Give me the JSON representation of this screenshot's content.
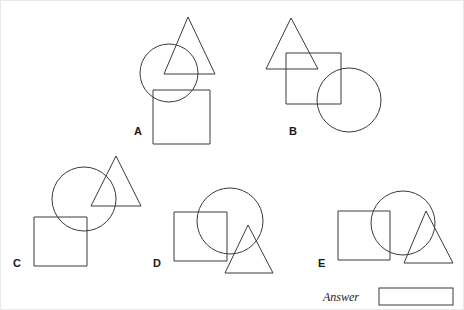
{
  "puzzle": {
    "type": "shape-overlap-multiple-choice",
    "background_color": "#ffffff",
    "stroke_color": "#3a3a3a",
    "options": [
      {
        "id": "A",
        "label": "A",
        "label_x": 133,
        "label_y": 134,
        "shapes": [
          {
            "kind": "triangle-icon",
            "points": "187,16 163,73 214,73"
          },
          {
            "kind": "circle-icon",
            "cx": 168,
            "cy": 72,
            "r": 29
          },
          {
            "kind": "square-icon",
            "x": 152,
            "y": 89,
            "w": 57,
            "h": 54
          }
        ]
      },
      {
        "id": "B",
        "label": "B",
        "label_x": 288,
        "label_y": 134,
        "shapes": [
          {
            "kind": "triangle-icon",
            "points": "290,17 265,68 317,68"
          },
          {
            "kind": "square-icon",
            "x": 285,
            "y": 52,
            "w": 55,
            "h": 51
          },
          {
            "kind": "circle-icon",
            "cx": 348,
            "cy": 99,
            "r": 32
          }
        ]
      },
      {
        "id": "C",
        "label": "C",
        "label_x": 12,
        "label_y": 266,
        "shapes": [
          {
            "kind": "triangle-icon",
            "points": "115,155 90,205 140,205"
          },
          {
            "kind": "circle-icon",
            "cx": 83,
            "cy": 198,
            "r": 32
          },
          {
            "kind": "square-icon",
            "x": 33,
            "y": 216,
            "w": 53,
            "h": 49
          }
        ]
      },
      {
        "id": "D",
        "label": "D",
        "label_x": 152,
        "label_y": 266,
        "shapes": [
          {
            "kind": "circle-icon",
            "cx": 229,
            "cy": 220,
            "r": 33
          },
          {
            "kind": "square-icon",
            "x": 173,
            "y": 211,
            "w": 53,
            "h": 49
          },
          {
            "kind": "triangle-icon",
            "points": "247,224 224,272 272,272"
          }
        ]
      },
      {
        "id": "E",
        "label": "E",
        "label_x": 317,
        "label_y": 266,
        "shapes": [
          {
            "kind": "circle-icon",
            "cx": 402,
            "cy": 222,
            "r": 32
          },
          {
            "kind": "square-icon",
            "x": 337,
            "y": 210,
            "w": 52,
            "h": 49
          },
          {
            "kind": "triangle-icon",
            "points": "425,210 403,262 452,262"
          }
        ]
      }
    ]
  },
  "answer": {
    "label": "Answer",
    "label_x": 322,
    "label_y": 300,
    "value": "",
    "placeholder": "",
    "box": {
      "x": 378,
      "y": 287,
      "w": 74,
      "h": 17
    }
  }
}
